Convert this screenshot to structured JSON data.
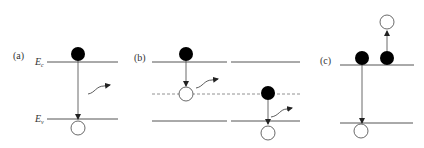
{
  "figure": {
    "panels": [
      {
        "id": "a",
        "label": "(a)",
        "conduction_band_label": "E",
        "conduction_band_sub": "c",
        "valence_band_label": "E",
        "valence_band_sub": "v",
        "description": "band-to-band radiative recombination"
      },
      {
        "id": "b",
        "label": "(b)",
        "description": "recombination via trap level (two-step, dashed mid-gap level)"
      },
      {
        "id": "c",
        "label": "(c)",
        "description": "Auger recombination"
      }
    ],
    "colors": {
      "line": "#555555",
      "dashed": "#777777",
      "electron": "#000000",
      "hole_fill": "#ffffff",
      "hole_stroke": "#444444"
    }
  }
}
